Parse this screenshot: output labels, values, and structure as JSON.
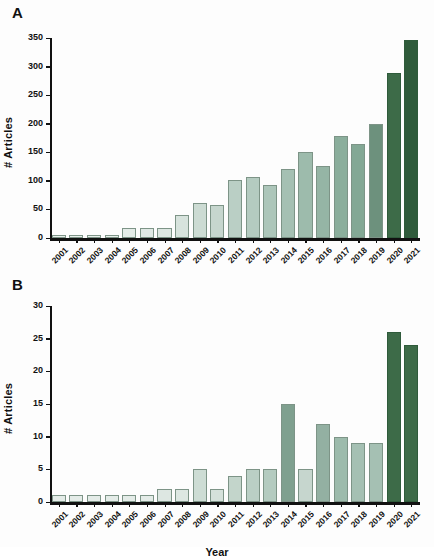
{
  "figure": {
    "panel_a_letter": "A",
    "panel_b_letter": "B",
    "xlabel": "Year",
    "ylabel": "# Articles",
    "colors": {
      "bar_lightest": "#e9f0ec",
      "bar_light": "#d3e0da",
      "bar_mid_light": "#bdd0c7",
      "bar_mid": "#a8c0b4",
      "bar_mid_dark": "#93b0a2",
      "bar_dark_mid": "#7fa08f",
      "bar_dark": "#6d917d",
      "bar_darkest": "#3d6b48",
      "bar_outline": "#7d9487",
      "axis": "#111111",
      "background": "#fdfdfd"
    }
  },
  "chart_data": [
    {
      "type": "bar",
      "panel": "A",
      "title": "",
      "xlabel": "Year",
      "ylabel": "# Articles",
      "categories": [
        "2001",
        "2002",
        "2003",
        "2004",
        "2005",
        "2006",
        "2007",
        "2008",
        "2009",
        "2010",
        "2011",
        "2012",
        "2013",
        "2014",
        "2015",
        "2016",
        "2017",
        "2018",
        "2019",
        "2020",
        "2021"
      ],
      "values": [
        6,
        6,
        6,
        6,
        17,
        18,
        17,
        41,
        62,
        57,
        101,
        107,
        93,
        121,
        151,
        126,
        178,
        164,
        200,
        288,
        347
      ],
      "ylim": [
        0,
        350
      ],
      "yticks": [
        0,
        50,
        100,
        150,
        200,
        250,
        300,
        350
      ],
      "grid": false,
      "legend": "none",
      "bar_colors": [
        "#e9f0ec",
        "#e9f0ec",
        "#e9f0ec",
        "#e9f0ec",
        "#e4ece8",
        "#e0e9e5",
        "#dde7e2",
        "#d7e3dd",
        "#ccdbd3",
        "#c6d6ce",
        "#bacfc5",
        "#b4cbc0",
        "#adc6ba",
        "#a5c0b3",
        "#9dbbac",
        "#95b5a5",
        "#8bae9c",
        "#83a895",
        "#6d917d",
        "#3d6b48",
        "#2f5b3b"
      ]
    },
    {
      "type": "bar",
      "panel": "B",
      "title": "",
      "xlabel": "Year",
      "ylabel": "# Articles",
      "categories": [
        "2001",
        "2002",
        "2003",
        "2004",
        "2005",
        "2006",
        "2007",
        "2008",
        "2009",
        "2010",
        "2011",
        "2012",
        "2013",
        "2014",
        "2015",
        "2016",
        "2017",
        "2018",
        "2019",
        "2020",
        "2021"
      ],
      "values": [
        1,
        1,
        1,
        1,
        1,
        1,
        2,
        2,
        5,
        2,
        4,
        5,
        5,
        15,
        5,
        12,
        10,
        9,
        9,
        26,
        24
      ],
      "ylim": [
        0,
        30
      ],
      "yticks": [
        0,
        5,
        10,
        15,
        20,
        25,
        30
      ],
      "grid": false,
      "legend": "none",
      "bar_colors": [
        "#e4ece8",
        "#e4ece8",
        "#e4ece8",
        "#e4ece8",
        "#e4ece8",
        "#e4ece8",
        "#dde7e2",
        "#dde7e2",
        "#cddcd4",
        "#d5e1db",
        "#c3d5cb",
        "#bacfc5",
        "#b4cbc0",
        "#7fa08f",
        "#c6d6ce",
        "#93b0a2",
        "#9dbbac",
        "#a5c0b3",
        "#a5c0b3",
        "#3d6b48",
        "#3d6b48"
      ]
    }
  ]
}
